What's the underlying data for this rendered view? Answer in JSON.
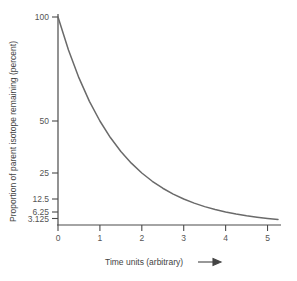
{
  "chart_data": {
    "type": "line",
    "title": "",
    "subtitle": "",
    "xlabel": "Time units (arbitrary)",
    "ylabel": "Proportion of parent isotope remaining (percent)",
    "xlim": [
      0,
      5.25
    ],
    "ylim": [
      0,
      100
    ],
    "grid": false,
    "legend": null,
    "x_ticks": [
      "0",
      "1",
      "2",
      "3",
      "4",
      "5"
    ],
    "x_tick_values": [
      0,
      1,
      2,
      3,
      4,
      5
    ],
    "y_ticks": [
      "100",
      "50",
      "25",
      "12.5",
      "6.25",
      "3.125"
    ],
    "y_tick_values": [
      100,
      50,
      25,
      12.5,
      6.25,
      3.125
    ],
    "series": [
      {
        "name": "Parent isotope remaining",
        "color": "#6a6a6a",
        "x": [
          0,
          0.25,
          0.5,
          0.75,
          1,
          1.25,
          1.5,
          1.75,
          2,
          2.25,
          2.5,
          2.75,
          3,
          3.25,
          3.5,
          3.75,
          4,
          4.25,
          4.5,
          4.75,
          5,
          5.25
        ],
        "values": [
          100,
          84.09,
          70.71,
          59.46,
          50,
          42.04,
          35.36,
          29.73,
          25,
          21.02,
          17.68,
          14.87,
          12.5,
          10.51,
          8.84,
          7.43,
          6.25,
          5.26,
          4.42,
          3.72,
          3.125,
          2.63
        ]
      }
    ],
    "annotations": [
      {
        "name": "x-axis-arrow",
        "label": "",
        "shape": "right-arrow"
      }
    ]
  },
  "axis_titles": {
    "x": "Time units (arbitrary)",
    "y": "Proportion of parent isotope remaining (percent)"
  },
  "colors": {
    "background": "#ffffff",
    "curve": "#6a6a6a",
    "axis": "#4a4a4a",
    "text": "#555555"
  }
}
